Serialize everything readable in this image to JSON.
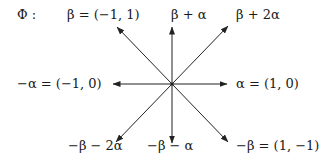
{
  "title": "Φ :",
  "center": {
    "x": 172,
    "y": 84
  },
  "stroke_color": "#222222",
  "roots": [
    {
      "id": "beta",
      "label": "β = (−1, 1)",
      "vector": [
        -1,
        1
      ],
      "tip": {
        "x": 117,
        "y": 27
      }
    },
    {
      "id": "beta-plus-alpha",
      "label": "β + α",
      "vector": [
        0,
        1
      ],
      "tip": {
        "x": 172,
        "y": 27
      }
    },
    {
      "id": "beta-plus-2alpha",
      "label": "β + 2α",
      "vector": [
        1,
        1
      ],
      "tip": {
        "x": 228,
        "y": 26
      }
    },
    {
      "id": "alpha",
      "label": "α = (1, 0)",
      "vector": [
        1,
        0
      ],
      "tip": {
        "x": 227,
        "y": 84
      }
    },
    {
      "id": "minus-alpha",
      "label": "−α = (−1, 0)",
      "vector": [
        -1,
        0
      ],
      "tip": {
        "x": 113,
        "y": 84
      }
    },
    {
      "id": "minus-beta-minus-2alpha",
      "label": "−β − 2α",
      "vector": [
        -1,
        -1
      ],
      "tip": {
        "x": 116,
        "y": 142
      }
    },
    {
      "id": "minus-beta-minus-alpha",
      "label": "−β − α",
      "vector": [
        0,
        -1
      ],
      "tip": {
        "x": 172,
        "y": 143
      }
    },
    {
      "id": "minus-beta",
      "label": "−β = (1, −1)",
      "vector": [
        1,
        -1
      ],
      "tip": {
        "x": 228,
        "y": 142
      }
    }
  ]
}
